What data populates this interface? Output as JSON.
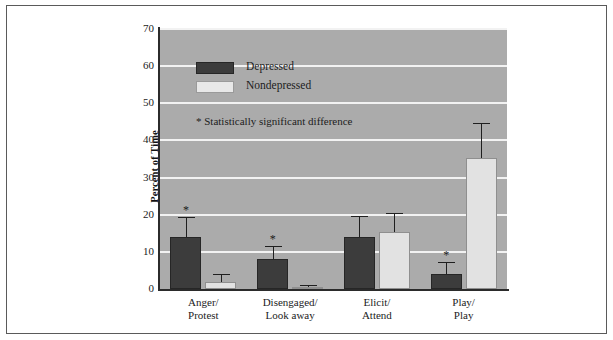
{
  "chart_data": {
    "type": "bar",
    "title": "",
    "xlabel": "",
    "ylabel": "Percent of Time",
    "ylim": [
      0,
      70
    ],
    "yticks": [
      0,
      10,
      20,
      30,
      40,
      50,
      60,
      70
    ],
    "ytick_labels": [
      "0",
      "10",
      "20",
      "30",
      "40",
      "50",
      "60",
      "70"
    ],
    "grid": "horizontal",
    "legend_position": "upper-left-inside",
    "categories": [
      "Anger/\nProtest",
      "Disengaged/\nLook away",
      "Elicit/\nAttend",
      "Play/\nPlay"
    ],
    "category_lines": [
      [
        "Anger/",
        "Protest"
      ],
      [
        "Disengaged/",
        "Look away"
      ],
      [
        "Elicit/",
        "Attend"
      ],
      [
        "Play/",
        "Play"
      ]
    ],
    "series": [
      {
        "name": "Depressed",
        "color": "#3c3c3c",
        "values": [
          14.0,
          8.0,
          14.0,
          4.0
        ],
        "error_upper": [
          5.5,
          3.7,
          5.7,
          3.3
        ],
        "significant": [
          true,
          true,
          false,
          true
        ]
      },
      {
        "name": "Nondepressed",
        "color": "#e2e2e2",
        "values": [
          2.0,
          0.6,
          15.3,
          35.2
        ],
        "error_upper": [
          2.0,
          0.6,
          5.2,
          9.6
        ],
        "significant": [
          false,
          false,
          false,
          false
        ]
      }
    ],
    "annotations": [
      {
        "text": "* Statistically significant difference",
        "type": "footnote-inside-plot"
      }
    ],
    "significance_marker": "*"
  },
  "legend": {
    "items": [
      {
        "label": "Depressed",
        "swatch": "dark-swatch"
      },
      {
        "label": "Nondepressed",
        "swatch": "light-swatch"
      }
    ],
    "note": "* Statistically significant difference"
  },
  "axes": {
    "y_title": "Percent of Time",
    "y_labels": [
      "70",
      "60",
      "50",
      "40",
      "30",
      "20",
      "10",
      "0"
    ],
    "x_labels": [
      {
        "line1": "Anger/",
        "line2": "Protest"
      },
      {
        "line1": "Disengaged/",
        "line2": "Look away"
      },
      {
        "line1": "Elicit/",
        "line2": "Attend"
      },
      {
        "line1": "Play/",
        "line2": "Play"
      }
    ]
  },
  "colors": {
    "plot_background": "#ababab",
    "gridline": "#f2f2f2",
    "depressed": "#3c3c3c",
    "nondepressed": "#e2e2e2",
    "axis": "#2b2b2b",
    "frame": "#5a5a5a",
    "page": "#ffffff"
  }
}
